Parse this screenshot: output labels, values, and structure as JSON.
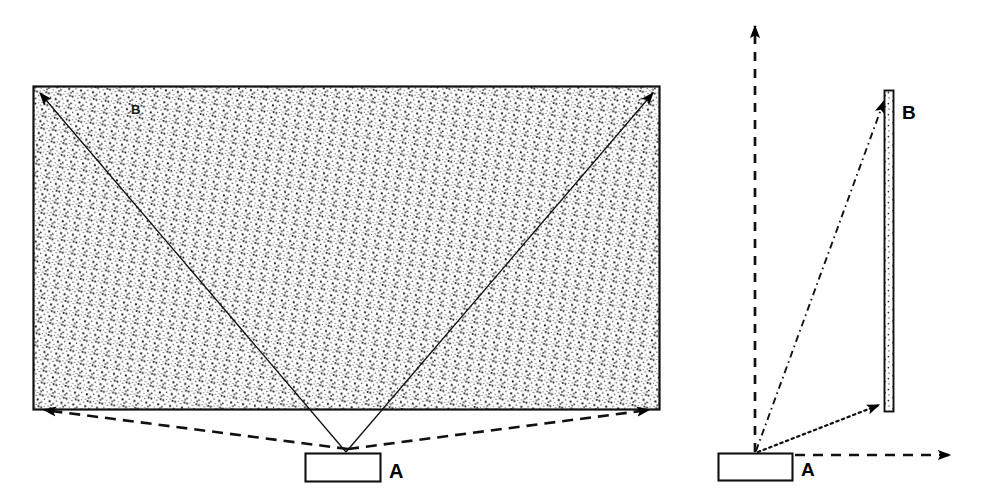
{
  "diagram": {
    "background_color": "#ffffff",
    "stroke_color": "#000000",
    "fill_texture": "stipple-dots",
    "panels": [
      {
        "id": "left-panel",
        "name": "front-elevation-view",
        "shapes": [
          {
            "name": "coverage-area-rectangle",
            "type": "rectangle",
            "label": "B",
            "label_x": 136,
            "label_y": 110,
            "x": 33,
            "y": 86,
            "width": 627,
            "height": 324,
            "fill": "stipple",
            "stroke": "#000000"
          },
          {
            "name": "source-box-a",
            "type": "rectangle",
            "label": "A",
            "label_x": 389,
            "label_y": 473,
            "x": 305,
            "y": 453,
            "width": 76,
            "height": 29,
            "fill": "#ffffff",
            "stroke": "#000000"
          }
        ],
        "rays": [
          {
            "name": "ray-to-top-left-corner",
            "style": "solid",
            "from_x": 346,
            "from_y": 452,
            "to_x": 36,
            "to_y": 89,
            "arrow": "end"
          },
          {
            "name": "ray-to-top-right-corner",
            "style": "solid",
            "from_x": 346,
            "from_y": 452,
            "to_x": 657,
            "to_y": 89,
            "arrow": "end"
          },
          {
            "name": "ray-to-bottom-left-corner",
            "style": "dashed",
            "from_x": 346,
            "from_y": 449,
            "to_x": 36,
            "to_y": 409,
            "arrow": "end"
          },
          {
            "name": "ray-to-bottom-right-corner",
            "style": "dashed",
            "from_x": 346,
            "from_y": 449,
            "to_x": 657,
            "to_y": 409,
            "arrow": "end"
          }
        ]
      },
      {
        "id": "right-panel",
        "name": "side-elevation-view",
        "shapes": [
          {
            "name": "coverage-plane-bar",
            "type": "rectangle",
            "label": "B",
            "label_x": 903,
            "label_y": 117,
            "x": 884,
            "y": 90,
            "width": 10,
            "height": 322,
            "fill": "stipple",
            "stroke": "#000000"
          },
          {
            "name": "source-box-a",
            "type": "rectangle",
            "label": "A",
            "label_x": 802,
            "label_y": 473,
            "x": 718,
            "y": 453,
            "width": 75,
            "height": 28,
            "fill": "#ffffff",
            "stroke": "#000000"
          }
        ],
        "rays": [
          {
            "name": "vertical-reference-axis",
            "style": "dashed",
            "from_x": 755,
            "from_y": 450,
            "to_x": 755,
            "to_y": 18,
            "arrow": "end"
          },
          {
            "name": "horizontal-reference-axis",
            "style": "dashed",
            "from_x": 795,
            "from_y": 455,
            "to_x": 958,
            "to_y": 455,
            "arrow": "end"
          },
          {
            "name": "ray-to-bar-top",
            "style": "dash-dot",
            "from_x": 756,
            "from_y": 451,
            "to_x": 886,
            "to_y": 96,
            "arrow": "end"
          },
          {
            "name": "ray-to-bar-bottom",
            "style": "dotted",
            "from_x": 757,
            "from_y": 452,
            "to_x": 884,
            "to_y": 409,
            "arrow": "end"
          }
        ]
      }
    ],
    "labels": {
      "left_area_label": "B",
      "left_source_label": "A",
      "right_area_label": "B",
      "right_source_label": "A"
    }
  }
}
